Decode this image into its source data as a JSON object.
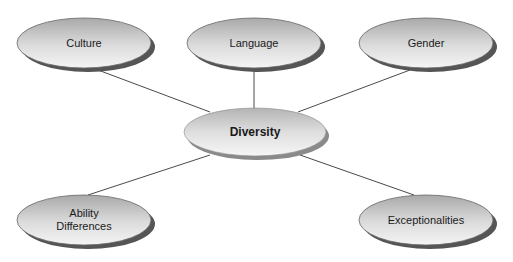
{
  "diagram": {
    "type": "mind-map",
    "center": {
      "id": "diversity",
      "label": "Diversity",
      "x": 255,
      "y": 133
    },
    "nodes": [
      {
        "id": "culture",
        "label": "Culture",
        "x": 84,
        "y": 44
      },
      {
        "id": "language",
        "label": "Language",
        "x": 254,
        "y": 44
      },
      {
        "id": "gender",
        "label": "Gender",
        "x": 426,
        "y": 44
      },
      {
        "id": "ability-differences",
        "label": "Ability Differences",
        "lines": [
          "Ability",
          "Differences"
        ],
        "x": 84,
        "y": 221
      },
      {
        "id": "exceptionalities",
        "label": "Exceptionalities",
        "x": 426,
        "y": 221
      }
    ],
    "edges": [
      {
        "from": "culture",
        "to": "diversity"
      },
      {
        "from": "language",
        "to": "diversity"
      },
      {
        "from": "gender",
        "to": "diversity"
      },
      {
        "from": "ability-differences",
        "to": "diversity"
      },
      {
        "from": "exceptionalities",
        "to": "diversity"
      }
    ],
    "colors": {
      "ellipse_light": "#f2f2f2",
      "ellipse_dark": "#a8a8a8",
      "shadow": "#5a5a5a",
      "line": "#4a4a4a"
    }
  }
}
